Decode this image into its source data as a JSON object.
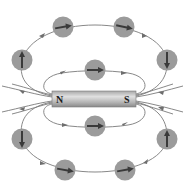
{
  "colors": {
    "background": "#ffffff",
    "field_line": "#7a7a7a",
    "compass_fill": "#9b9b9b",
    "needle": "#3a3a3a",
    "magnet_light": "#d9d9d9",
    "magnet_dark": "#8f8f8f"
  },
  "magnet": {
    "north_label": "N",
    "south_label": "S"
  },
  "compasses": [
    {
      "id": "top-left",
      "cx": 63,
      "cy": 27,
      "angle": -10
    },
    {
      "id": "top-right",
      "cx": 124,
      "cy": 27,
      "angle": 12
    },
    {
      "id": "upper-left-side",
      "cx": 22,
      "cy": 60,
      "angle": -90
    },
    {
      "id": "upper-right-side",
      "cx": 167,
      "cy": 60,
      "angle": 90
    },
    {
      "id": "inner-top",
      "cx": 95,
      "cy": 70,
      "angle": 0
    },
    {
      "id": "inner-bottom",
      "cx": 95,
      "cy": 126,
      "angle": 0
    },
    {
      "id": "lower-left-side",
      "cx": 22,
      "cy": 139,
      "angle": 90
    },
    {
      "id": "lower-right-side",
      "cx": 167,
      "cy": 139,
      "angle": -90
    },
    {
      "id": "bottom-left",
      "cx": 65,
      "cy": 170,
      "angle": 10
    },
    {
      "id": "bottom-right",
      "cx": 125,
      "cy": 170,
      "angle": -10
    }
  ]
}
